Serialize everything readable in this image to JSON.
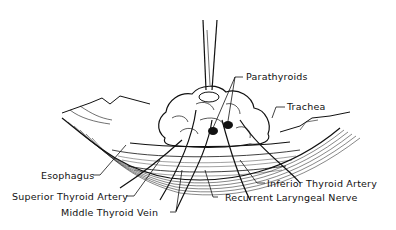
{
  "figure": {
    "type": "anatomical-illustration",
    "style": "black-and-white line drawing"
  },
  "labels": {
    "parathyroids": "Parathyroids",
    "trachea": "Trachea",
    "esophagus": "Esophagus",
    "superior_thyroid_artery": "Superior Thyroid Artery",
    "middle_thyroid_vein": "Middle Thyroid Vein",
    "inferior_thyroid_artery": "Inferior Thyroid Artery",
    "recurrent_laryngeal_nerve": "Recurrent Laryngeal Nerve"
  },
  "colors": {
    "ink": "#111111",
    "background": "#ffffff"
  }
}
